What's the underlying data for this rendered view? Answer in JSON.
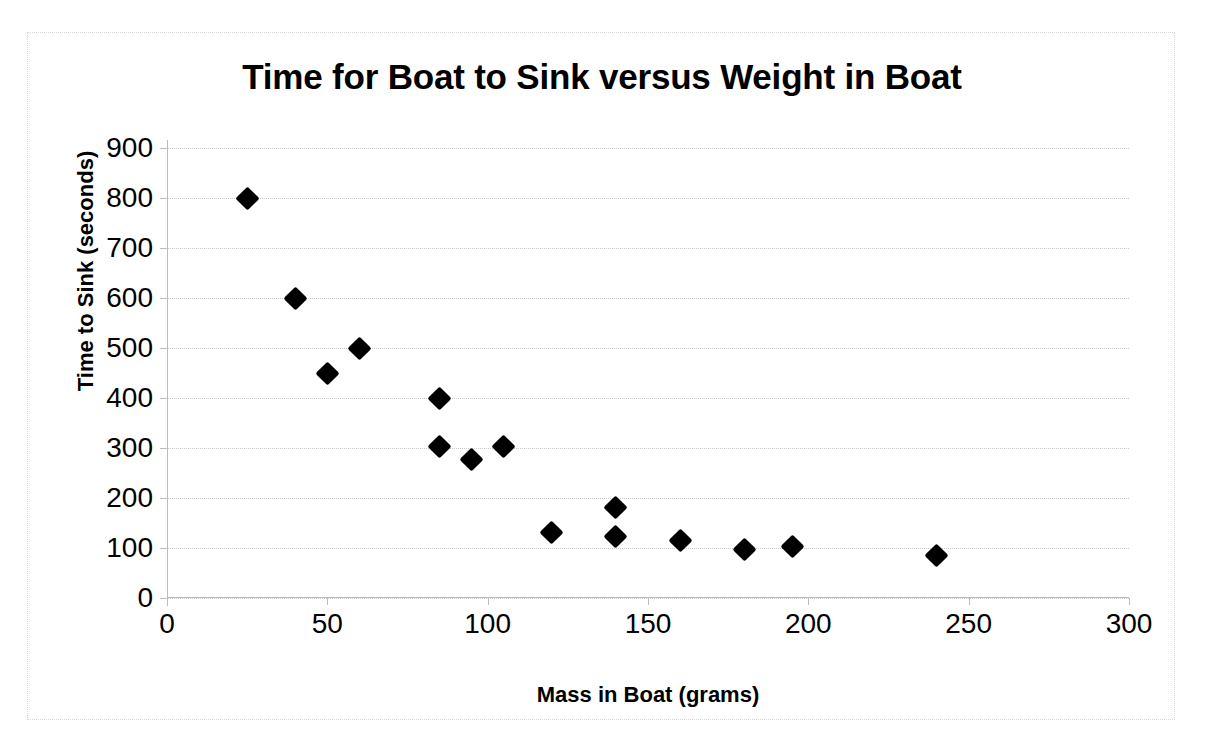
{
  "chart_data": {
    "type": "scatter",
    "title": "Time for Boat to Sink versus Weight in Boat",
    "xlabel": "Mass in Boat (grams)",
    "ylabel": "Time to Sink (seconds)",
    "xlim": [
      0,
      300
    ],
    "ylim": [
      0,
      900
    ],
    "xticks": [
      0,
      50,
      100,
      150,
      200,
      250,
      300
    ],
    "yticks": [
      0,
      100,
      200,
      300,
      400,
      500,
      600,
      700,
      800,
      900
    ],
    "xtick_labels": [
      "0",
      "50",
      "100",
      "150",
      "200",
      "250",
      "300"
    ],
    "ytick_labels": [
      "0",
      "100",
      "200",
      "300",
      "400",
      "500",
      "600",
      "700",
      "800",
      "900"
    ],
    "grid": "horizontal",
    "legend": "none",
    "marker": "diamond",
    "marker_color": "#000000",
    "series": [
      {
        "name": "Time to Sink",
        "points": [
          {
            "x": 25,
            "y": 800
          },
          {
            "x": 40,
            "y": 600
          },
          {
            "x": 50,
            "y": 450
          },
          {
            "x": 60,
            "y": 500
          },
          {
            "x": 85,
            "y": 400
          },
          {
            "x": 85,
            "y": 303
          },
          {
            "x": 95,
            "y": 278
          },
          {
            "x": 105,
            "y": 303
          },
          {
            "x": 120,
            "y": 132
          },
          {
            "x": 140,
            "y": 182
          },
          {
            "x": 140,
            "y": 123
          },
          {
            "x": 160,
            "y": 115
          },
          {
            "x": 180,
            "y": 98
          },
          {
            "x": 195,
            "y": 104
          },
          {
            "x": 240,
            "y": 85
          }
        ]
      }
    ]
  },
  "style": {
    "background": "#ffffff",
    "frame_border": "#d8d8d8",
    "gridline_color": "#c9c9c9",
    "axis_color": "#bdbdbd",
    "text_color": "#000000"
  }
}
